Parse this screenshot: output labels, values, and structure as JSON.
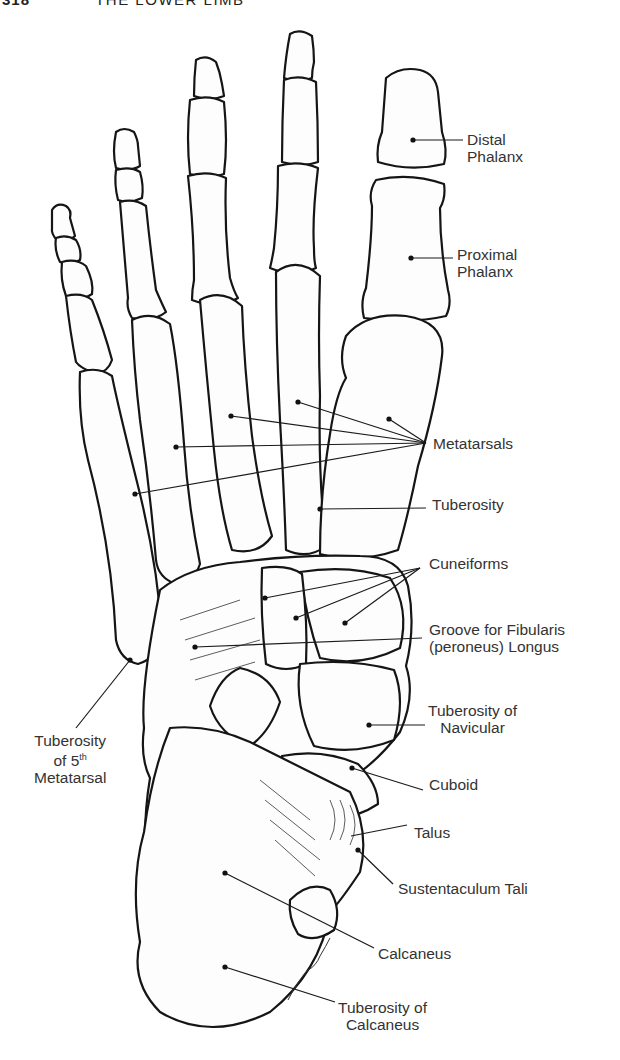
{
  "page": {
    "page_number": "318",
    "running_title": "THE LOWER LIMB"
  },
  "figure": {
    "signature": "Lewell",
    "labels": [
      {
        "id": "distal-phalanx",
        "lines": [
          "Distal",
          "Phalanx"
        ]
      },
      {
        "id": "proximal-phalanx",
        "lines": [
          "Proximal",
          "Phalanx"
        ]
      },
      {
        "id": "metatarsals",
        "lines": [
          "Metatarsals"
        ]
      },
      {
        "id": "tuberosity",
        "lines": [
          "Tuberosity"
        ]
      },
      {
        "id": "cuneiforms",
        "lines": [
          "Cuneiforms"
        ]
      },
      {
        "id": "groove-fibularis",
        "lines": [
          "Groove for Fibularis",
          "(peroneus) Longus"
        ]
      },
      {
        "id": "tuberosity-navicular",
        "lines": [
          "Tuberosity of",
          "Navicular"
        ]
      },
      {
        "id": "cuboid",
        "lines": [
          "Cuboid"
        ]
      },
      {
        "id": "talus",
        "lines": [
          "Talus"
        ]
      },
      {
        "id": "sustentaculum-tali",
        "lines": [
          "Sustentaculum Tali"
        ]
      },
      {
        "id": "calcaneus",
        "lines": [
          "Calcaneus"
        ]
      },
      {
        "id": "tuberosity-calcaneus",
        "lines": [
          "Tuberosity of",
          "Calcaneus"
        ]
      },
      {
        "id": "tuberosity-5th-metatarsal",
        "lines": [
          "Tuberosity",
          "of 5",
          "Metatarsal"
        ],
        "superscript": "th"
      }
    ]
  }
}
